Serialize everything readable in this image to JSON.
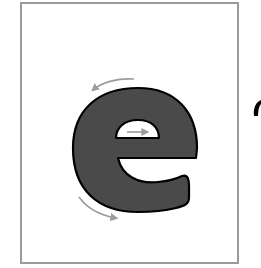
{
  "diagram": {
    "letter": "e",
    "colors": {
      "frame_border": "#9a9a9a",
      "letter_fill": "#4a4a4a",
      "letter_outline": "#000000",
      "arrow": "#9c9c9c",
      "counter_fill": "#ffffff"
    },
    "arrows": [
      {
        "name": "start-stroke-arrow",
        "direction": "right",
        "position": "inside counter"
      },
      {
        "name": "top-curve-arrow",
        "direction": "counter-clockwise (left)",
        "position": "top-left of letter"
      },
      {
        "name": "bottom-curve-arrow",
        "direction": "clockwise (right)",
        "position": "bottom-left of letter"
      }
    ]
  }
}
